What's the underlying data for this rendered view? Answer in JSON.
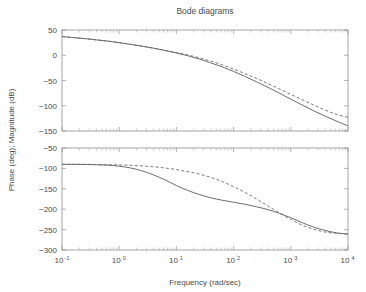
{
  "figure": {
    "title": "Bode diagrams",
    "width": 366,
    "height": 292,
    "background": "#ffffff",
    "line_color": "#5a5a5a",
    "axis_color": "#909090",
    "text_color": "#4a4a4a"
  },
  "axes": {
    "xlabel": "Frequency (rad/sec)",
    "ylabel": "Phase (deg); Magnitude (dB)",
    "x_tick_labels": [
      "10-1",
      "100",
      "101",
      "102",
      "103",
      "104"
    ],
    "x_tick_bases": [
      "10",
      "10",
      "10",
      "10",
      "10",
      "10"
    ],
    "x_tick_exponents": [
      "-1",
      "0",
      "1",
      "2",
      "3",
      "4"
    ],
    "magnitude_y_ticks": [
      "50",
      "0",
      "-50",
      "-100",
      "-150"
    ],
    "phase_y_ticks": [
      "-50",
      "-100",
      "-150",
      "-200",
      "-250",
      "-300"
    ]
  },
  "chart_data": [
    {
      "type": "line",
      "title": "Bode diagrams",
      "subplot": "magnitude",
      "xlabel": "Frequency (rad/sec)",
      "ylabel": "Magnitude (dB)",
      "xscale": "log",
      "xlim": [
        0.1,
        10000
      ],
      "ylim": [
        -150,
        50
      ],
      "yticks": [
        -150,
        -100,
        -50,
        0,
        50
      ],
      "xticks": [
        0.1,
        1,
        10,
        100,
        1000,
        10000
      ],
      "grid": false,
      "legend": null,
      "series": [
        {
          "name": "solid",
          "style": "solid",
          "color": "#5a5a5a",
          "x": [
            0.1,
            0.158,
            0.251,
            0.398,
            0.631,
            1.0,
            1.585,
            2.512,
            3.981,
            6.31,
            10.0,
            15.85,
            25.12,
            39.81,
            63.1,
            100.0,
            158.5,
            251.2,
            398.1,
            631.0,
            1000.0,
            1585.0,
            2512.0,
            3981.0,
            6310.0,
            10000.0
          ],
          "y": [
            37,
            35,
            33,
            30.5,
            28,
            25,
            21.5,
            18,
            14,
            9.5,
            4.5,
            -1.0,
            -7.5,
            -15,
            -23,
            -32,
            -42,
            -52.5,
            -63.5,
            -75,
            -87,
            -98.5,
            -110,
            -120.5,
            -130.5,
            -140
          ]
        },
        {
          "name": "dashed",
          "style": "dashed",
          "color": "#6a6a6a",
          "x": [
            0.1,
            0.158,
            0.251,
            0.398,
            0.631,
            1.0,
            1.585,
            2.512,
            3.981,
            6.31,
            10.0,
            15.85,
            25.12,
            39.81,
            63.1,
            100.0,
            158.5,
            251.2,
            398.1,
            631.0,
            1000.0,
            1585.0,
            2512.0,
            3981.0,
            6310.0,
            10000.0
          ],
          "y": [
            37,
            35,
            33,
            30.5,
            28,
            25,
            21.5,
            18,
            14,
            9.8,
            5.2,
            0.5,
            -5.0,
            -11.5,
            -19,
            -27.5,
            -36.5,
            -46,
            -56,
            -66.5,
            -77.5,
            -88,
            -98.5,
            -108.5,
            -117,
            -123
          ]
        }
      ]
    },
    {
      "type": "line",
      "subplot": "phase",
      "xlabel": "Frequency (rad/sec)",
      "ylabel": "Phase (deg)",
      "xscale": "log",
      "xlim": [
        0.1,
        10000
      ],
      "ylim": [
        -300,
        -50
      ],
      "yticks": [
        -300,
        -250,
        -200,
        -150,
        -100,
        -50
      ],
      "xticks": [
        0.1,
        1,
        10,
        100,
        1000,
        10000
      ],
      "grid": false,
      "legend": null,
      "series": [
        {
          "name": "solid",
          "style": "solid",
          "color": "#5a5a5a",
          "x": [
            0.1,
            0.158,
            0.251,
            0.398,
            0.631,
            1.0,
            1.585,
            2.512,
            3.981,
            6.31,
            10.0,
            15.85,
            25.12,
            39.81,
            63.1,
            100.0,
            158.5,
            251.2,
            398.1,
            631.0,
            1000.0,
            1585.0,
            2512.0,
            3981.0,
            6310.0,
            10000.0
          ],
          "y": [
            -90,
            -90,
            -90.5,
            -91,
            -92,
            -94.5,
            -99,
            -106,
            -116,
            -128,
            -142,
            -154,
            -164,
            -172,
            -178,
            -183,
            -188,
            -194,
            -201,
            -210,
            -221,
            -233,
            -244,
            -252,
            -258,
            -261
          ]
        },
        {
          "name": "dashed",
          "style": "dashed",
          "color": "#6a6a6a",
          "x": [
            0.1,
            0.158,
            0.251,
            0.398,
            0.631,
            1.0,
            1.585,
            2.512,
            3.981,
            6.31,
            10.0,
            15.85,
            25.12,
            39.81,
            63.1,
            100.0,
            158.5,
            251.2,
            398.1,
            631.0,
            1000.0,
            1585.0,
            2512.0,
            3981.0,
            6310.0,
            10000.0
          ],
          "y": [
            -90,
            -90,
            -90,
            -90.5,
            -91,
            -91.5,
            -92.5,
            -94,
            -96,
            -99,
            -103,
            -108,
            -114,
            -122,
            -132,
            -145,
            -159,
            -175,
            -192,
            -209,
            -225,
            -239,
            -249,
            -256,
            -259,
            -261
          ]
        }
      ]
    }
  ]
}
